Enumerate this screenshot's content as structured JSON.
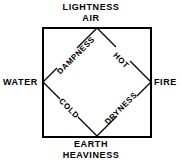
{
  "diagram": {
    "type": "square-with-inscribed-diamond",
    "colors": {
      "background": "#ffffff",
      "stroke": "#000000",
      "text": "#000000"
    },
    "outer_square": {
      "x": 42,
      "y": 27,
      "width": 110,
      "height": 111,
      "stroke_width": 2
    },
    "inner_diamond": {
      "vertices": [
        {
          "name": "top",
          "x": 97,
          "y": 27
        },
        {
          "name": "right",
          "x": 152,
          "y": 82
        },
        {
          "name": "bottom",
          "x": 97,
          "y": 138
        },
        {
          "name": "left",
          "x": 42,
          "y": 82
        }
      ],
      "stroke_width": 1
    },
    "elements": {
      "top": "AIR",
      "left": "WATER",
      "right": "FIRE",
      "bottom": "EARTH"
    },
    "attributes": {
      "above_top": "LIGHTNESS",
      "below_bottom": "HEAVINESS"
    },
    "qualities": {
      "upper_left": "DAMPNESS",
      "upper_right": "HOT",
      "lower_left": "COLD",
      "lower_right": "DRYNESS"
    }
  }
}
